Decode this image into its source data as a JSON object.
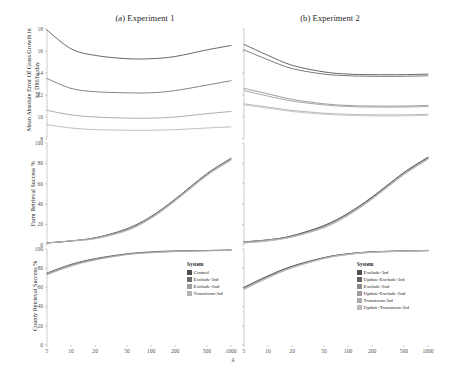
{
  "figure": {
    "panel_a_title": "(a) Experiment 1",
    "panel_b_title": "(b) Experiment 2",
    "xlabel": "λ"
  },
  "rows": {
    "r1_ylabel": "Mean Absolute Error Of Grass Growth in kg DM/ha/day",
    "r2_ylabel": "Farm Retrieval Success %",
    "r3_ylabel": "County Retrieval Success %"
  },
  "axes": {
    "x_ticks": [
      "5",
      "10",
      "20",
      "50",
      "100",
      "200",
      "500",
      "1000"
    ],
    "x_values": [
      5,
      10,
      20,
      50,
      100,
      200,
      500,
      1000
    ],
    "r1_y_ticks": [
      "8",
      "10",
      "12",
      "14",
      "16",
      "18"
    ],
    "r2_y_ticks": [
      "0",
      "20",
      "40",
      "60",
      "80",
      "100"
    ],
    "r3_y_ticks": [
      "0",
      "20",
      "40",
      "60",
      "80",
      "100"
    ]
  },
  "legend_a": {
    "title": "System",
    "items": [
      {
        "label": "Control",
        "color": "#4d4d4d"
      },
      {
        "label": "Exclude-3rd",
        "color": "#6e6e6e"
      },
      {
        "label": "Exclude-2nd",
        "color": "#9e9e9e"
      },
      {
        "label": "Transform-3rd",
        "color": "#b4b4b4"
      }
    ]
  },
  "legend_b": {
    "title": "System",
    "items": [
      {
        "label": "Exclude-3rd",
        "color": "#4d4d4d"
      },
      {
        "label": "Update-Exclude-3rd",
        "color": "#626262"
      },
      {
        "label": "Exclude-2nd",
        "color": "#8a8a8a"
      },
      {
        "label": "Update-Exclude-2nd",
        "color": "#9c9c9c"
      },
      {
        "label": "Transform-3rd",
        "color": "#ababab"
      },
      {
        "label": "Update-Transform-3rd",
        "color": "#bdbdbd"
      }
    ]
  },
  "chart_data": {
    "type": "line",
    "xlabel": "λ",
    "xscale": "log",
    "xlim": [
      5,
      1000
    ],
    "x": [
      5,
      10,
      20,
      50,
      100,
      200,
      500,
      1000
    ],
    "grid": false,
    "legend_position": "inside-right",
    "panels": [
      {
        "panel": "(a) Experiment 1",
        "row": 1,
        "ylabel": "Mean Absolute Error Of Grass Growth in kg DM/ha/day",
        "ylim": [
          8,
          18
        ],
        "series": [
          {
            "name": "Control",
            "color": "#4d4d4d",
            "values": [
              17.9,
              16.2,
              15.6,
              15.3,
              15.3,
              15.5,
              16.1,
              16.5
            ]
          },
          {
            "name": "Exclude-3rd",
            "color": "#6e6e6e",
            "values": [
              13.5,
              12.6,
              12.3,
              12.2,
              12.2,
              12.4,
              12.9,
              13.3
            ]
          },
          {
            "name": "Exclude-2nd",
            "color": "#9e9e9e",
            "values": [
              10.6,
              10.2,
              10.0,
              9.9,
              9.9,
              10.0,
              10.3,
              10.5
            ]
          },
          {
            "name": "Transform-3rd",
            "color": "#b4b4b4",
            "values": [
              9.3,
              9.0,
              8.85,
              8.8,
              8.8,
              8.85,
              9.0,
              9.1
            ]
          }
        ]
      },
      {
        "panel": "(b) Experiment 2",
        "row": 1,
        "ylabel": "Mean Absolute Error Of Grass Growth in kg DM/ha/day",
        "ylim": [
          8,
          18
        ],
        "series": [
          {
            "name": "Exclude-3rd",
            "color": "#4d4d4d",
            "values": [
              16.6,
              15.6,
              14.7,
              14.1,
              13.9,
              13.85,
              13.85,
              13.9
            ]
          },
          {
            "name": "Update-Exclude-3rd",
            "color": "#626262",
            "values": [
              16.1,
              15.2,
              14.4,
              13.9,
              13.75,
              13.7,
              13.7,
              13.75
            ]
          },
          {
            "name": "Exclude-2nd",
            "color": "#8a8a8a",
            "values": [
              12.6,
              12.1,
              11.6,
              11.2,
              11.05,
              11.0,
              11.0,
              11.05
            ]
          },
          {
            "name": "Update-Exclude-2nd",
            "color": "#9c9c9c",
            "values": [
              12.4,
              11.9,
              11.45,
              11.1,
              10.95,
              10.9,
              10.9,
              10.95
            ]
          },
          {
            "name": "Transform-3rd",
            "color": "#ababab",
            "values": [
              11.2,
              10.9,
              10.6,
              10.35,
              10.25,
              10.2,
              10.2,
              10.25
            ]
          },
          {
            "name": "Update-Transform-3rd",
            "color": "#bdbdbd",
            "values": [
              11.1,
              10.8,
              10.5,
              10.25,
              10.15,
              10.1,
              10.1,
              10.15
            ]
          }
        ]
      },
      {
        "panel": "(a) Experiment 1",
        "row": 2,
        "ylabel": "Farm Retrieval Success %",
        "ylim": [
          0,
          100
        ],
        "series": [
          {
            "name": "Control",
            "color": "#4d4d4d",
            "values": [
              2,
              4,
              7,
              16,
              28,
              45,
              70,
              85
            ]
          },
          {
            "name": "Exclude-3rd",
            "color": "#6e6e6e",
            "values": [
              2,
              4,
              7,
              15,
              27,
              44,
              69,
              84
            ]
          },
          {
            "name": "Exclude-2nd",
            "color": "#9e9e9e",
            "values": [
              2,
              4,
              7,
              15,
              27,
              44,
              69,
              84
            ]
          },
          {
            "name": "Transform-3rd",
            "color": "#b4b4b4",
            "values": [
              2,
              4,
              6,
              14,
              26,
              43,
              68,
              83
            ]
          }
        ]
      },
      {
        "panel": "(b) Experiment 2",
        "row": 2,
        "ylabel": "Farm Retrieval Success %",
        "ylim": [
          0,
          100
        ],
        "series": [
          {
            "name": "Exclude-3rd",
            "color": "#4d4d4d",
            "values": [
              3,
              5,
              9,
              19,
              31,
              47,
              71,
              86
            ]
          },
          {
            "name": "Update-Exclude-3rd",
            "color": "#626262",
            "values": [
              3,
              5,
              9,
              19,
              31,
              47,
              71,
              86
            ]
          },
          {
            "name": "Exclude-2nd",
            "color": "#8a8a8a",
            "values": [
              3,
              5,
              8,
              18,
              30,
              46,
              70,
              85
            ]
          },
          {
            "name": "Update-Exclude-2nd",
            "color": "#9c9c9c",
            "values": [
              3,
              5,
              8,
              18,
              30,
              46,
              70,
              85
            ]
          },
          {
            "name": "Transform-3rd",
            "color": "#ababab",
            "values": [
              2,
              4,
              8,
              17,
              29,
              45,
              69,
              84
            ]
          },
          {
            "name": "Update-Transform-3rd",
            "color": "#bdbdbd",
            "values": [
              2,
              4,
              8,
              17,
              29,
              45,
              69,
              84
            ]
          }
        ]
      },
      {
        "panel": "(a) Experiment 1",
        "row": 3,
        "ylabel": "County Retrieval Success %",
        "ylim": [
          0,
          100
        ],
        "series": [
          {
            "name": "Control",
            "color": "#4d4d4d",
            "values": [
              75,
              84,
              90,
              95,
              97,
              98,
              98.5,
              99
            ]
          },
          {
            "name": "Exclude-3rd",
            "color": "#6e6e6e",
            "values": [
              74,
              83,
              89,
              94.5,
              96.5,
              97.5,
              98.3,
              98.7
            ]
          },
          {
            "name": "Exclude-2nd",
            "color": "#9e9e9e",
            "values": [
              74,
              83,
              89,
              94.5,
              96.5,
              97.5,
              98.3,
              98.7
            ]
          },
          {
            "name": "Transform-3rd",
            "color": "#b4b4b4",
            "values": [
              73,
              82,
              88.5,
              94,
              96,
              97.3,
              98,
              98.5
            ]
          }
        ]
      },
      {
        "panel": "(b) Experiment 2",
        "row": 3,
        "ylabel": "County Retrieval Success %",
        "ylim": [
          0,
          100
        ],
        "series": [
          {
            "name": "Exclude-3rd",
            "color": "#4d4d4d",
            "values": [
              60,
              72,
              82,
              91,
              95,
              97,
              98,
              98.5
            ]
          },
          {
            "name": "Update-Exclude-3rd",
            "color": "#626262",
            "values": [
              60,
              72,
              82,
              91,
              95,
              97,
              98,
              98.5
            ]
          },
          {
            "name": "Exclude-2nd",
            "color": "#8a8a8a",
            "values": [
              59,
              71,
              81,
              90.5,
              94.5,
              96.7,
              97.8,
              98.3
            ]
          },
          {
            "name": "Update-Exclude-2nd",
            "color": "#9c9c9c",
            "values": [
              59,
              71,
              81,
              90.5,
              94.5,
              96.7,
              97.8,
              98.3
            ]
          },
          {
            "name": "Transform-3rd",
            "color": "#ababab",
            "values": [
              58,
              70,
              80.5,
              90,
              94.3,
              96.5,
              97.6,
              98.2
            ]
          },
          {
            "name": "Update-Transform-3rd",
            "color": "#bdbdbd",
            "values": [
              58,
              70,
              80.5,
              90,
              94.3,
              96.5,
              97.6,
              98.2
            ]
          }
        ]
      }
    ]
  }
}
